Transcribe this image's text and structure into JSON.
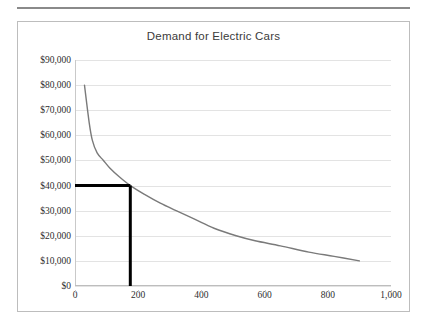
{
  "chart_data": {
    "type": "line",
    "title": "Demand for Electric Cars",
    "xlabel": "",
    "ylabel": "",
    "xlim": [
      0,
      1000
    ],
    "ylim": [
      0,
      90000
    ],
    "grid": true,
    "legend": "none",
    "line_color": "#7a7a7a",
    "marker_color": "#000000",
    "x_ticks": [
      0,
      200,
      400,
      600,
      800,
      1000
    ],
    "x_tick_labels": [
      "0",
      "200",
      "400",
      "600",
      "800",
      "1,000"
    ],
    "y_ticks": [
      0,
      10000,
      20000,
      30000,
      40000,
      50000,
      60000,
      70000,
      80000,
      90000
    ],
    "y_tick_labels": [
      "$0",
      "$10,000",
      "$20,000",
      "$30,000",
      "$40,000",
      "$50,000",
      "$60,000",
      "$70,000",
      "$80,000",
      "$90,000"
    ],
    "series": [
      {
        "name": "Demand",
        "points": [
          [
            30,
            80000
          ],
          [
            45,
            65000
          ],
          [
            55,
            58000
          ],
          [
            70,
            53000
          ],
          [
            90,
            50000
          ],
          [
            110,
            47000
          ],
          [
            140,
            43500
          ],
          [
            175,
            40000
          ],
          [
            220,
            36500
          ],
          [
            270,
            33000
          ],
          [
            320,
            30000
          ],
          [
            380,
            26500
          ],
          [
            440,
            23000
          ],
          [
            510,
            20000
          ],
          [
            570,
            18000
          ],
          [
            650,
            16000
          ],
          [
            740,
            13500
          ],
          [
            820,
            11800
          ],
          [
            900,
            10000
          ]
        ]
      }
    ],
    "annotations": [
      {
        "name": "equilibrium-price-marker",
        "type": "horizontal-segment",
        "y_value": 40000,
        "x_from": 0,
        "x_to": 175,
        "color": "#000000"
      },
      {
        "name": "equilibrium-quantity-marker",
        "type": "vertical-segment",
        "x_value": 175,
        "y_from": 0,
        "y_to": 40000,
        "color": "#000000"
      }
    ]
  }
}
